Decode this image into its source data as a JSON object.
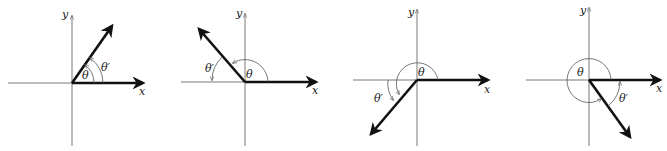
{
  "diagram": {
    "axis_labels": {
      "x": "x",
      "y": "y"
    },
    "angle_label": "θ",
    "reference_angle_label": "θ′",
    "panels": [
      {
        "quadrant": "I",
        "theta_label": "θ",
        "ref_label": "θ′",
        "x_label": "x",
        "y_label": "y"
      },
      {
        "quadrant": "II",
        "theta_label": "θ",
        "ref_label": "θ′",
        "x_label": "x",
        "y_label": "y"
      },
      {
        "quadrant": "III",
        "theta_label": "θ",
        "ref_label": "θ′",
        "x_label": "x",
        "y_label": "y"
      },
      {
        "quadrant": "IV",
        "theta_label": "θ",
        "ref_label": "θ′",
        "x_label": "x",
        "y_label": "y"
      }
    ]
  }
}
